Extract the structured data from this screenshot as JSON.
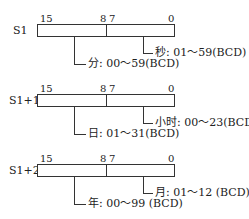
{
  "registers": [
    {
      "name": "S1",
      "bits": {
        "high_start": "15",
        "high_end": "8",
        "low_start": "7",
        "low_end": "0"
      },
      "high_field": "分: 00～59(BCD)",
      "low_field": "秒: 01～59(BCD)"
    },
    {
      "name": "S1+1",
      "bits": {
        "high_start": "15",
        "high_end": "8",
        "low_start": "7",
        "low_end": "0"
      },
      "high_field": "日: 01～31(BCD)",
      "low_field": "小时: 00～23(BCD)"
    },
    {
      "name": "S1+2",
      "bits": {
        "high_start": "15",
        "high_end": "8",
        "low_start": "7",
        "low_end": "0"
      },
      "high_field": "年: 00～99 (BCD)",
      "low_field": "月: 01～12 (BCD)"
    }
  ]
}
